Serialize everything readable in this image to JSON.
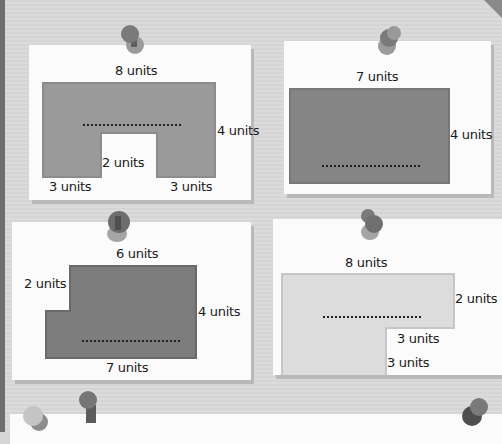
{
  "cards": [
    {
      "id": "card-1",
      "shape": "U-shape (rectangle with notch)",
      "fill": "#9a9a9a",
      "labels": {
        "top": "8 units",
        "right": "4 units",
        "notch": "2 units",
        "bottom_left": "3 units",
        "bottom_right": "3 units"
      },
      "answer_blank": "........................"
    },
    {
      "id": "card-2",
      "shape": "rectangle",
      "fill": "#858585",
      "labels": {
        "top": "7 units",
        "right": "4 units"
      },
      "answer_blank": "........................"
    },
    {
      "id": "card-3",
      "shape": "L-shape (step on left)",
      "fill": "#7c7c7c",
      "labels": {
        "top": "6 units",
        "left": "2 units",
        "right": "4 units",
        "bottom": "7 units"
      },
      "answer_blank": "........................"
    },
    {
      "id": "card-4",
      "shape": "L-shape (notch bottom right)",
      "fill": "#dcdcdc",
      "labels": {
        "top": "8 units",
        "right": "2 units",
        "inner_horizontal": "3 units",
        "inner_vertical": "3 units"
      },
      "answer_blank": "........................"
    }
  ],
  "colors": {
    "board": "#d9d9d9",
    "card": "#fbfbfb",
    "pin_dark": "#6f6f6f",
    "pin_light": "#b5b5b5"
  }
}
